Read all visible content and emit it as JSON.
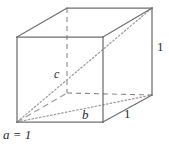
{
  "figure": {
    "kind": "geometry-diagram",
    "background_color": "#ffffff",
    "line_color": "#6e6e6e",
    "hidden_line_color": "#8a8a8a",
    "diagonal_line_color": "#9a9a9a",
    "label_color": "#2b2b2b",
    "labels": {
      "edge_a": "a = 1",
      "edge_b": "b",
      "edge_c": "c",
      "right_height": "1",
      "bottom_depth": "1"
    },
    "vertices": {
      "front_top_left": [
        17,
        37
      ],
      "front_top_right": [
        103,
        37
      ],
      "front_bottom_left": [
        17,
        122
      ],
      "front_bottom_right": [
        103,
        122
      ],
      "back_top_left": [
        67,
        8
      ],
      "back_top_right": [
        152,
        8
      ],
      "back_bottom_left": [
        67,
        93
      ],
      "back_bottom_right": [
        152,
        95
      ]
    },
    "edges_solid": [
      "front_top_left-front_top_right",
      "front_top_right-front_bottom_right",
      "front_bottom_right-front_bottom_left",
      "front_bottom_left-front_top_left",
      "front_top_left-back_top_left",
      "front_top_right-back_top_right",
      "front_bottom_right-back_bottom_right",
      "back_top_left-back_top_right",
      "back_top_right-back_bottom_right"
    ],
    "edges_hidden_dashed": [
      "back_top_left-back_bottom_left",
      "back_bottom_left-back_bottom_right",
      "front_bottom_left-back_bottom_left"
    ],
    "diagonals_dotted": [
      "front_bottom_left-back_top_right",
      "front_bottom_left-back_bottom_right"
    ]
  }
}
